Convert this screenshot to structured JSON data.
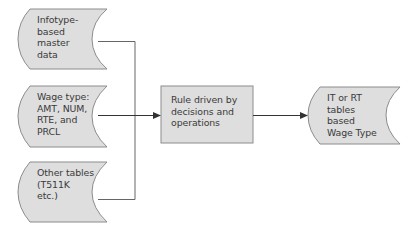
{
  "diagram": {
    "colors": {
      "fill": "#dedede",
      "stroke": "#8c8c8c",
      "line": "#444444",
      "text": "#3a3a3a"
    },
    "inputs": [
      {
        "id": "infotype",
        "lines": [
          "Infotype-",
          "based",
          "master",
          "data"
        ]
      },
      {
        "id": "wage-type",
        "lines": [
          "Wage type:",
          "AMT, NUM,",
          "RTE, and",
          "PRCL"
        ]
      },
      {
        "id": "other-tables",
        "lines": [
          "Other tables",
          "(T511K",
          "etc.)"
        ]
      }
    ],
    "process": {
      "id": "rule",
      "lines": [
        "Rule driven by",
        "decisions and",
        "operations"
      ]
    },
    "output": {
      "id": "result",
      "lines": [
        "IT or RT",
        "tables",
        "based",
        "Wage Type"
      ]
    }
  }
}
